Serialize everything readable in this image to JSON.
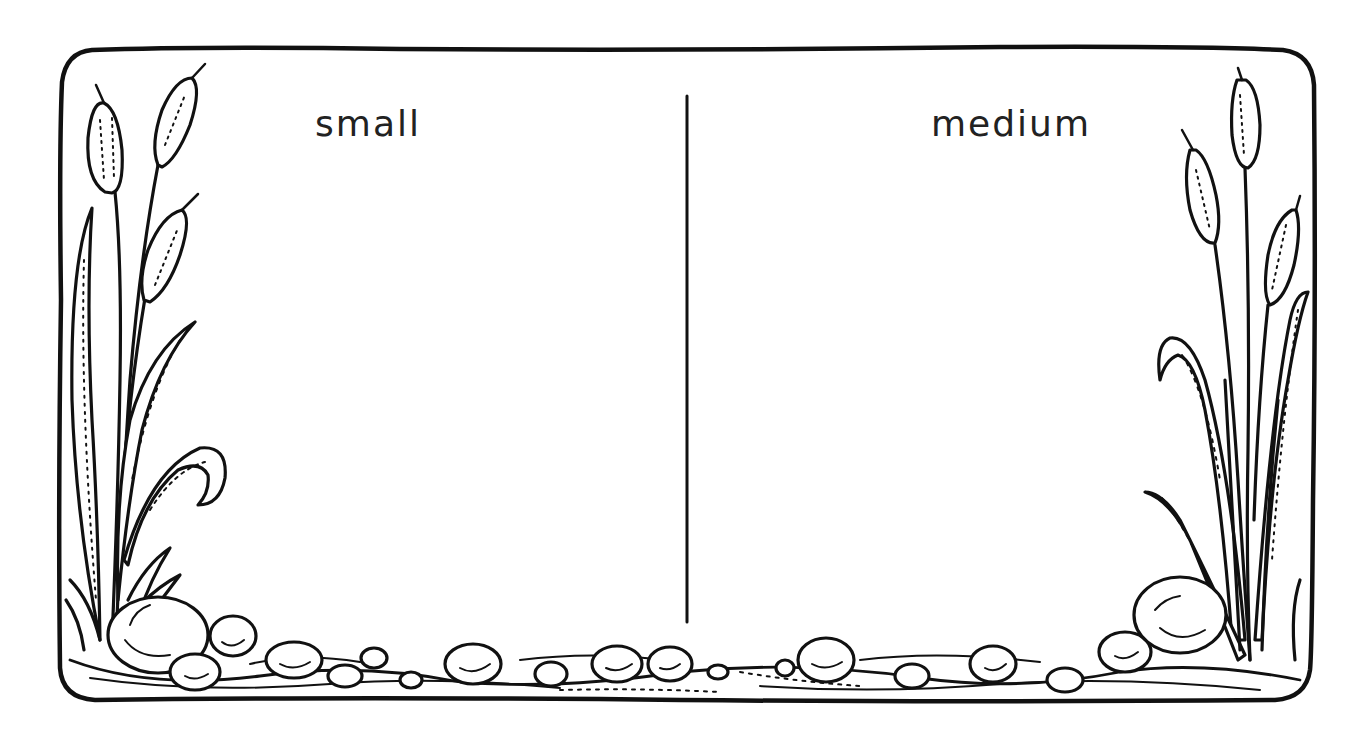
{
  "worksheet": {
    "type": "sorting-mat",
    "columns": [
      {
        "label": "small"
      },
      {
        "label": "medium"
      }
    ]
  },
  "colors": {
    "ink": "#111111",
    "paper": "#ffffff",
    "label_text": "#222222"
  },
  "decorations": {
    "left_corner": "cattails-and-rocks",
    "right_corner": "cattails-and-rocks",
    "bottom_border": "pebbles-and-stream"
  }
}
